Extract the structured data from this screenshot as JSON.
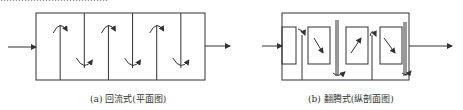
{
  "diagrams": [
    {
      "id": "a",
      "caption": "(a) 回流式(平面图)",
      "type": "round-trip baffled channel, plan view",
      "compartments": 7,
      "inlet": "left",
      "outlet": "right"
    },
    {
      "id": "b",
      "caption": "(b) 翻腾式(纵剖面图)",
      "type": "tumbling baffled channel, longitudinal section",
      "inner_chambers": 5,
      "inlet": "left",
      "outlet": "right"
    }
  ],
  "colors": {
    "line": "#333333",
    "caption": "#333333"
  }
}
